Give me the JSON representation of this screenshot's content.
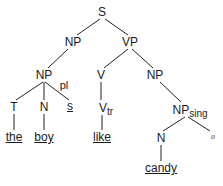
{
  "diagram": {
    "type": "syntax-tree",
    "nodes": {
      "s": {
        "label": "S"
      },
      "np1": {
        "label": "NP"
      },
      "vp": {
        "label": "VP"
      },
      "np2": {
        "label": "NP"
      },
      "pl": {
        "label": "pl"
      },
      "t": {
        "label": "T"
      },
      "n1": {
        "label": "N"
      },
      "suffix_s": {
        "label": "s"
      },
      "v": {
        "label": "V"
      },
      "vtr": {
        "label": "V",
        "sub": "tr"
      },
      "np3": {
        "label": "NP"
      },
      "npsing": {
        "label": "NP",
        "sub": "sing"
      },
      "n2": {
        "label": "N"
      },
      "null": {
        "label": "ø"
      },
      "the": {
        "label": "the"
      },
      "boy": {
        "label": "boy"
      },
      "like": {
        "label": "like"
      },
      "candy": {
        "label": "candy"
      }
    },
    "edges": [
      [
        "S",
        "NP"
      ],
      [
        "S",
        "VP"
      ],
      [
        "NP",
        "NP"
      ],
      [
        "NP",
        "T"
      ],
      [
        "NP",
        "N"
      ],
      [
        "NP",
        "s"
      ],
      [
        "T",
        "the"
      ],
      [
        "N",
        "boy"
      ],
      [
        "VP",
        "V"
      ],
      [
        "VP",
        "NP"
      ],
      [
        "V",
        "Vtr"
      ],
      [
        "Vtr",
        "like"
      ],
      [
        "NP",
        "NPsing"
      ],
      [
        "NPsing",
        "N"
      ],
      [
        "NPsing",
        "ø"
      ],
      [
        "N",
        "candy"
      ]
    ]
  }
}
